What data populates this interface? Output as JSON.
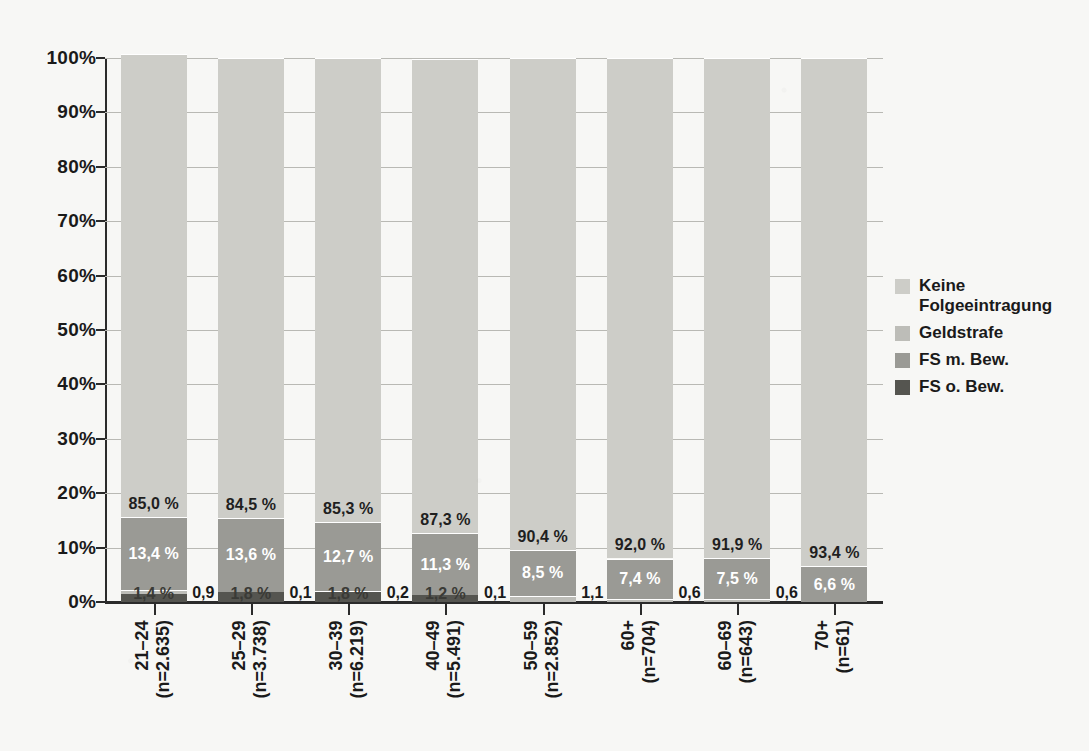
{
  "chart_data": {
    "type": "bar",
    "subtype": "stacked-100-percent",
    "title": "",
    "xlabel": "",
    "ylabel": "",
    "ylim": [
      0,
      100
    ],
    "ytick_labels": [
      "0%",
      "10%",
      "20%",
      "30%",
      "40%",
      "50%",
      "60%",
      "70%",
      "80%",
      "90%",
      "100%"
    ],
    "ytick_values": [
      0,
      10,
      20,
      30,
      40,
      50,
      60,
      70,
      80,
      90,
      100
    ],
    "grid": true,
    "legend_position": "right",
    "categories": [
      "21–24\n(n=2.635)",
      "25–29\n(n=3.738)",
      "30–39\n(n=6.219)",
      "40–49\n(n=5.491)",
      "50–59\n(n=2.852)",
      "60+\n(n=704)",
      "60–69\n(n=643)",
      "70+\n(n=61)"
    ],
    "category_labels": [
      {
        "range": "21–24",
        "n": "(n=2.635)"
      },
      {
        "range": "25–29",
        "n": "(n=3.738)"
      },
      {
        "range": "30–39",
        "n": "(n=6.219)"
      },
      {
        "range": "40–49",
        "n": "(n=5.491)"
      },
      {
        "range": "50–59",
        "n": "(n=2.852)"
      },
      {
        "range": "60+",
        "n": "(n=704)"
      },
      {
        "range": "60–69",
        "n": "(n=643)"
      },
      {
        "range": "70+",
        "n": "(n=61)"
      }
    ],
    "series": [
      {
        "name": "Keine Folgeeintragung",
        "color": "#cdcdc8",
        "values": [
          85.0,
          84.5,
          85.3,
          87.3,
          90.4,
          92.0,
          91.9,
          93.4
        ],
        "labels": [
          "85,0 %",
          "84,5 %",
          "85,3 %",
          "87,3 %",
          "90,4 %",
          "92,0 %",
          "91,9 %",
          "93,4 %"
        ],
        "label_placement": "inside"
      },
      {
        "name": "Geldstrafe",
        "color": "#bdbdb8",
        "values": [
          0.9,
          0.1,
          0.2,
          0.1,
          1.1,
          0.6,
          0.6,
          0.0
        ],
        "labels": [
          "0,9 %",
          "0,1 %",
          "0,2 %",
          "0,1 %",
          "1,1 %",
          "0,6 %",
          "0,6 %",
          ""
        ],
        "label_placement": "outside-baseline"
      },
      {
        "name": "FS m. Bew.",
        "color": "#9a9a95",
        "values": [
          13.4,
          13.6,
          12.7,
          11.3,
          8.5,
          7.4,
          7.5,
          6.6
        ],
        "labels": [
          "13,4 %",
          "13,6 %",
          "12,7 %",
          "11,3 %",
          "8,5 %",
          "7,4 %",
          "7,5 %",
          "6,6 %"
        ],
        "label_placement": "inside"
      },
      {
        "name": "FS o. Bew.",
        "color": "#555550",
        "values": [
          1.4,
          1.8,
          1.8,
          1.2,
          0.0,
          0.0,
          0.0,
          0.0
        ],
        "labels": [
          "1,4 %",
          "1,8 %",
          "1,8 %",
          "1,2 %",
          "",
          "",
          "",
          ""
        ],
        "label_placement": "inside-baseline"
      }
    ]
  },
  "legend": {
    "items": [
      {
        "label": "Keine Folgeeintragung",
        "color": "#cdcdc8"
      },
      {
        "label": "Geldstrafe",
        "color": "#bdbdb8"
      },
      {
        "label": "FS m. Bew.",
        "color": "#9a9a95"
      },
      {
        "label": "FS o. Bew.",
        "color": "#555550"
      }
    ]
  },
  "colors": {
    "background": "#f7f7f5",
    "axis": "#2b2b2b",
    "grid": "#b9b9b4",
    "text": "#1a1a1a",
    "label_light": "#ffffff"
  }
}
